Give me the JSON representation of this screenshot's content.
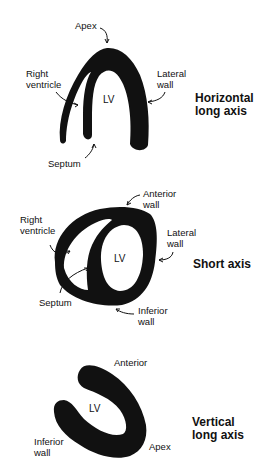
{
  "panels": [
    {
      "id": "horizontal-long-axis",
      "title": "Horizontal\nlong axis",
      "cavity_label": "LV",
      "labels": {
        "apex": "Apex",
        "right_ventricle": "Right\nventricle",
        "lateral_wall": "Lateral\nwall",
        "septum": "Septum"
      }
    },
    {
      "id": "short-axis",
      "title": "Short axis",
      "cavity_label": "LV",
      "labels": {
        "anterior_wall": "Anterior\nwall",
        "right_ventricle": "Right\nventricle",
        "lateral_wall": "Lateral\nwall",
        "septum": "Septum",
        "inferior_wall": "Inferior\nwall"
      }
    },
    {
      "id": "vertical-long-axis",
      "title": "Vertical\nlong axis",
      "cavity_label": "LV",
      "labels": {
        "anterior": "Anterior",
        "inferior_wall": "Inferior\nwall",
        "apex": "Apex"
      }
    }
  ],
  "colors": {
    "myocardium": "#111111",
    "background": "#ffffff"
  }
}
